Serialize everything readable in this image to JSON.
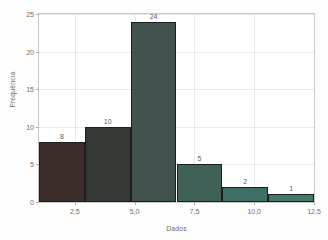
{
  "chart_data": {
    "type": "bar",
    "title": "",
    "subtitle": "",
    "xlabel": "Dados",
    "ylabel": "Frequência",
    "xlim": [
      1.0,
      12.5
    ],
    "ylim": [
      0,
      25
    ],
    "grid": true,
    "legend": null,
    "xticks": [
      "2,5",
      "5,0",
      "7,5",
      "10,0",
      "12,5"
    ],
    "xtick_values": [
      2.5,
      5.0,
      7.5,
      10.0,
      12.5
    ],
    "yticks": [
      "0",
      "5",
      "10",
      "15",
      "20",
      "25"
    ],
    "ytick_values": [
      0,
      5,
      10,
      15,
      20,
      25
    ],
    "bin_edges": [
      1.0,
      2.9167,
      4.8333,
      6.75,
      8.6667,
      10.5833,
      12.5
    ],
    "categories": [
      "1,0-2,9",
      "2,9-4,8",
      "4,8-6,8",
      "6,8-8,7",
      "8,7-10,6",
      "10,6-12,5"
    ],
    "values": [
      8,
      10,
      24,
      5,
      2,
      1
    ],
    "bar_labels": [
      "8",
      "10",
      "24",
      "5",
      "2",
      "1"
    ],
    "bar_colors": [
      "#3a2d2a",
      "#343835",
      "#42534f",
      "#406158",
      "#3f6f64",
      "#43796d"
    ],
    "bar_edge_color": "#1d1d1d",
    "grid_color": "#e9e9e9",
    "axis_color": "#c9c9c9",
    "text_color": "#6e6e6e",
    "background_color": "#ffffff"
  }
}
